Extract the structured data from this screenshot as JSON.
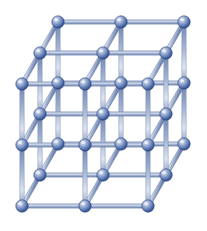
{
  "figure": {
    "name": "crystal-lattice",
    "title": "Simple cubic crystal lattice",
    "background_color": "#ffffff",
    "width": 207,
    "height": 231,
    "artifact_text": "( ) 6"
  },
  "lattice": {
    "type": "simple-cubic",
    "grid": {
      "nx": 3,
      "ny": 3,
      "nz": 3
    },
    "atom_count": 27,
    "bond_count": 54,
    "projection": "oblique",
    "front_face": {
      "left_x": 22,
      "right_x": 148,
      "top_y": 84,
      "bottom_y": 206,
      "cell_width": 63,
      "cell_height": 61
    },
    "depth_offset": {
      "dx": 18,
      "dy": -31
    },
    "atom_radius": 6.2,
    "bond_width": 4.2,
    "colors": {
      "atom_highlight": "#d8e0f0",
      "atom_mid": "#6f89bd",
      "atom_dark": "#2f4a83",
      "atom_edge": "#27407a",
      "bond_light": "#d2dae9",
      "bond_mid": "#93a5c8",
      "bond_dark": "#6c80ab",
      "background": "#ffffff"
    }
  },
  "chart_data": {
    "type": "scatter",
    "xlabel": "",
    "ylabel": "",
    "series": [
      {
        "name": "atoms",
        "points": [
          {
            "i": 0,
            "j": 0,
            "k": 0,
            "x": 22,
            "y": 206
          },
          {
            "i": 1,
            "j": 0,
            "k": 0,
            "x": 85,
            "y": 206
          },
          {
            "i": 2,
            "j": 0,
            "k": 0,
            "x": 148,
            "y": 206
          },
          {
            "i": 0,
            "j": 1,
            "k": 0,
            "x": 22,
            "y": 145
          },
          {
            "i": 1,
            "j": 1,
            "k": 0,
            "x": 85,
            "y": 145
          },
          {
            "i": 2,
            "j": 1,
            "k": 0,
            "x": 148,
            "y": 145
          },
          {
            "i": 0,
            "j": 2,
            "k": 0,
            "x": 22,
            "y": 84
          },
          {
            "i": 1,
            "j": 2,
            "k": 0,
            "x": 85,
            "y": 84
          },
          {
            "i": 2,
            "j": 2,
            "k": 0,
            "x": 148,
            "y": 84
          },
          {
            "i": 0,
            "j": 0,
            "k": 1,
            "x": 40,
            "y": 175
          },
          {
            "i": 1,
            "j": 0,
            "k": 1,
            "x": 103,
            "y": 175
          },
          {
            "i": 2,
            "j": 0,
            "k": 1,
            "x": 166,
            "y": 175
          },
          {
            "i": 0,
            "j": 1,
            "k": 1,
            "x": 40,
            "y": 114
          },
          {
            "i": 1,
            "j": 1,
            "k": 1,
            "x": 103,
            "y": 114
          },
          {
            "i": 2,
            "j": 1,
            "k": 1,
            "x": 166,
            "y": 114
          },
          {
            "i": 0,
            "j": 2,
            "k": 1,
            "x": 40,
            "y": 53
          },
          {
            "i": 1,
            "j": 2,
            "k": 1,
            "x": 103,
            "y": 53
          },
          {
            "i": 2,
            "j": 2,
            "k": 1,
            "x": 166,
            "y": 53
          },
          {
            "i": 0,
            "j": 0,
            "k": 2,
            "x": 58,
            "y": 144
          },
          {
            "i": 1,
            "j": 0,
            "k": 2,
            "x": 121,
            "y": 144
          },
          {
            "i": 2,
            "j": 0,
            "k": 2,
            "x": 184,
            "y": 144
          },
          {
            "i": 0,
            "j": 1,
            "k": 2,
            "x": 58,
            "y": 83
          },
          {
            "i": 1,
            "j": 1,
            "k": 2,
            "x": 121,
            "y": 83
          },
          {
            "i": 2,
            "j": 1,
            "k": 2,
            "x": 184,
            "y": 83
          },
          {
            "i": 0,
            "j": 2,
            "k": 2,
            "x": 58,
            "y": 22
          },
          {
            "i": 1,
            "j": 2,
            "k": 2,
            "x": 121,
            "y": 22
          },
          {
            "i": 2,
            "j": 2,
            "k": 2,
            "x": 184,
            "y": 22
          }
        ]
      }
    ]
  }
}
